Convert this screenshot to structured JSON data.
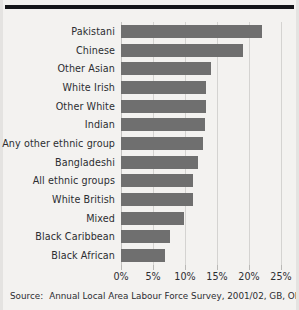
{
  "chart_data": {
    "type": "bar",
    "orientation": "horizontal",
    "title": "",
    "subtitle": "",
    "xlabel": "",
    "ylabel": "",
    "xlim": [
      0,
      25
    ],
    "xunit": "%",
    "grid": true,
    "legend": null,
    "xticks": [
      0,
      5,
      10,
      15,
      20,
      25
    ],
    "xtick_labels": [
      "0%",
      "5%",
      "10%",
      "15%",
      "20%",
      "25%"
    ],
    "categories": [
      "Pakistani",
      "Chinese",
      "Other Asian",
      "White Irish",
      "Other White",
      "Indian",
      "Any other ethnic group",
      "Bangladeshi",
      "All ethnic groups",
      "White British",
      "Mixed",
      "Black Caribbean",
      "Black African"
    ],
    "values": [
      22.0,
      19.1,
      14.1,
      13.3,
      13.3,
      13.1,
      12.8,
      12.0,
      11.2,
      11.2,
      9.8,
      7.7,
      6.9
    ],
    "bar_color": "#6f6f6f",
    "grid_color": "#d4d3d1",
    "background_color": "#f3f2f0"
  },
  "source": {
    "label": "Source:",
    "text": "Annual Local Area Labour Force Survey, 2001/02, GB, ONS"
  }
}
